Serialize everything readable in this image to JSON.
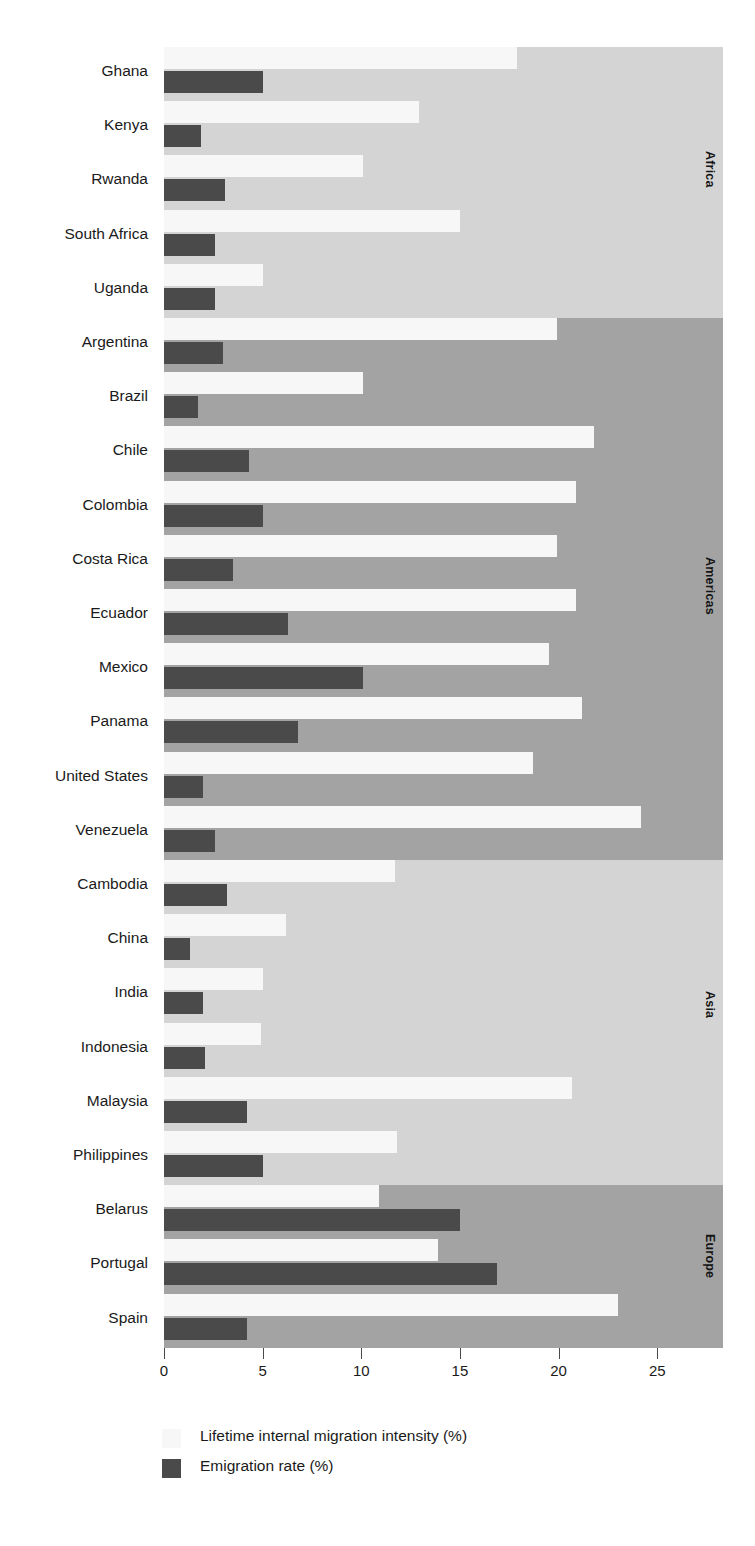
{
  "chart_data": {
    "type": "bar",
    "orientation": "horizontal",
    "title": "",
    "xlabel": "",
    "ylabel": "",
    "xlim": [
      0,
      28.5
    ],
    "xticks": [
      0,
      5,
      10,
      15,
      20,
      25
    ],
    "xtick_labels": [
      "0",
      "5",
      "10",
      "15",
      "20",
      "25"
    ],
    "grid": false,
    "legend_position": "bottom-left",
    "colors": {
      "light_bar": "#f7f7f7",
      "dark_bar": "#4a4a4a",
      "panel_light": "#d4d4d4",
      "panel_dark": "#a3a3a3",
      "axis": "#4a4a4a",
      "text": "#1a1a1a"
    },
    "series": [
      {
        "name": "Lifetime internal migration intensity (%)",
        "key": "migration",
        "color": "#f7f7f7"
      },
      {
        "name": "Emigration rate (%)",
        "key": "emigration",
        "color": "#4a4a4a"
      }
    ],
    "panels": [
      {
        "label": "Africa",
        "shade": "light",
        "categories": [
          "Ghana",
          "Kenya",
          "Rwanda",
          "South Africa",
          "Uganda"
        ],
        "migration": [
          17.9,
          12.9,
          10.1,
          15.0,
          5.0
        ],
        "emigration": [
          5.0,
          1.9,
          3.1,
          2.6,
          2.6
        ]
      },
      {
        "label": "Americas",
        "shade": "dark",
        "categories": [
          "Argentina",
          "Brazil",
          "Chile",
          "Colombia",
          "Costa Rica",
          "Ecuador",
          "Mexico",
          "Panama",
          "United States",
          "Venezuela"
        ],
        "migration": [
          19.9,
          10.1,
          21.8,
          20.9,
          19.9,
          20.9,
          19.5,
          21.2,
          18.7,
          24.2
        ],
        "emigration": [
          3.0,
          1.7,
          4.3,
          5.0,
          3.5,
          6.3,
          10.1,
          6.8,
          2.0,
          2.6
        ]
      },
      {
        "label": "Asia",
        "shade": "light",
        "categories": [
          "Cambodia",
          "China",
          "India",
          "Indonesia",
          "Malaysia",
          "Philippines"
        ],
        "migration": [
          11.7,
          6.2,
          5.0,
          4.9,
          20.7,
          11.8
        ],
        "emigration": [
          3.2,
          1.3,
          2.0,
          2.1,
          4.2,
          5.0
        ]
      },
      {
        "label": "Europe",
        "shade": "dark",
        "categories": [
          "Belarus",
          "Portugal",
          "Spain"
        ],
        "migration": [
          10.9,
          13.9,
          23.0
        ],
        "emigration": [
          15.0,
          16.9,
          4.2
        ]
      }
    ]
  },
  "legend": {
    "items": [
      {
        "label": "Lifetime internal migration intensity (%)",
        "color": "#f7f7f7"
      },
      {
        "label": "Emigration rate (%)",
        "color": "#4a4a4a"
      }
    ]
  },
  "axis": {
    "ticks": [
      "0",
      "5",
      "10",
      "15",
      "20",
      "25"
    ]
  }
}
